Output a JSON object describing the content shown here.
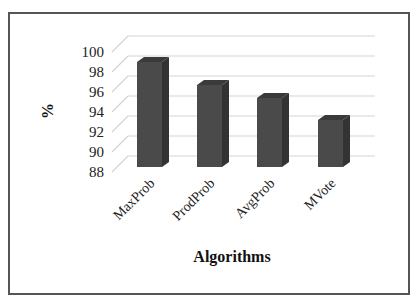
{
  "chart_data": {
    "type": "bar",
    "style": "3d-column",
    "title": "",
    "xlabel": "Algorithms",
    "ylabel": "%",
    "categories": [
      "MaxProb",
      "ProdProb",
      "AvgProb",
      "MVote"
    ],
    "values": [
      98.2,
      95.9,
      94.6,
      92.4
    ],
    "ylim": [
      88,
      100
    ],
    "yticks": [
      "100",
      "98",
      "96",
      "94",
      "92",
      "90",
      "88"
    ],
    "grid": true,
    "legend": "none",
    "colors": {
      "bar_front": "#4a4a4a",
      "bar_side": "#333333",
      "bar_top": "#3a3a3a",
      "grid": "#d4d4d4",
      "border": "#555555"
    }
  }
}
